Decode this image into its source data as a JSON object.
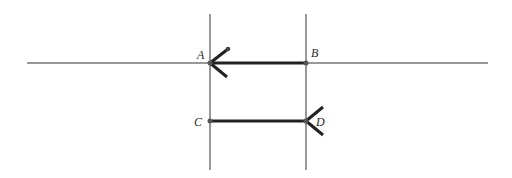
{
  "diagram": {
    "points": {
      "A": {
        "label": "A",
        "x": 210,
        "y": 63
      },
      "B": {
        "label": "B",
        "x": 306,
        "y": 63
      },
      "C": {
        "label": "C",
        "x": 210,
        "y": 121
      },
      "D": {
        "label": "D",
        "x": 306,
        "y": 121
      }
    },
    "lines": [
      {
        "name": "horizontal-line",
        "from": [
          27,
          63
        ],
        "to": [
          488,
          63
        ]
      },
      {
        "name": "vertical-line-left",
        "from": [
          210,
          14
        ],
        "to": [
          210,
          170
        ]
      },
      {
        "name": "vertical-line-right",
        "from": [
          306,
          14
        ],
        "to": [
          306,
          170
        ]
      }
    ],
    "segments": [
      {
        "name": "segment-AB",
        "from": "B",
        "to": "A",
        "arrow_at": "A"
      },
      {
        "name": "segment-CD",
        "from": "C",
        "to": "D",
        "arrow_at": "D"
      }
    ],
    "colors": {
      "thin_line": "#333333",
      "thick_line": "#222222",
      "background": "#ffffff"
    }
  }
}
